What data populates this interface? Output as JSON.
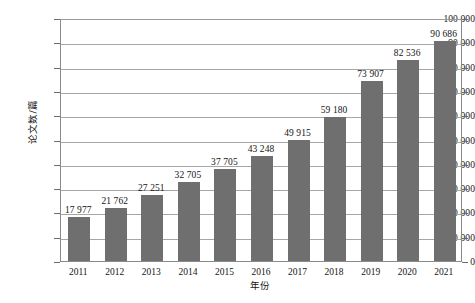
{
  "chart_data": {
    "type": "bar",
    "title": "",
    "subtitle": "",
    "xlabel": "年份",
    "ylabel": "论文数/篇",
    "categories": [
      "2011",
      "2012",
      "2013",
      "2014",
      "2015",
      "2016",
      "2017",
      "2018",
      "2019",
      "2020",
      "2021"
    ],
    "values": [
      17977,
      21762,
      27251,
      32705,
      37705,
      43248,
      49915,
      59180,
      73907,
      82536,
      90686
    ],
    "value_labels": [
      "17 977",
      "21 762",
      "27 251",
      "32 705",
      "37 705",
      "43 248",
      "49 915",
      "59 180",
      "73 907",
      "82 536",
      "90 686"
    ],
    "ylim": [
      0,
      100000
    ],
    "ytick_values": [
      0,
      10000,
      20000,
      30000,
      40000,
      50000,
      60000,
      70000,
      80000,
      90000,
      100000
    ],
    "ytick_labels": [
      "0",
      "10 000",
      "20 000",
      "30 000",
      "40 000",
      "50 000",
      "60 000",
      "70 000",
      "80 000",
      "90 000",
      "100 000"
    ],
    "grid": true,
    "legend": false,
    "legend_position": "none",
    "series": [
      {
        "name": "论文数",
        "color": "#6f6f6f",
        "values": [
          17977,
          21762,
          27251,
          32705,
          37705,
          43248,
          49915,
          59180,
          73907,
          82536,
          90686
        ]
      }
    ]
  },
  "colors": {
    "bar": "#6f6f6f",
    "grid": "#a6a6a6",
    "axis": "#8a8a8a",
    "text": "#141414",
    "background": "#ffffff"
  }
}
